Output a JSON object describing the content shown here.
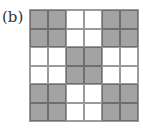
{
  "label": "(b)",
  "grid": {
    "rows": 6,
    "cols": 6,
    "shaded_color": "#a3a3a3",
    "empty_color": "#ffffff",
    "cells": [
      [
        1,
        1,
        0,
        0,
        1,
        1
      ],
      [
        1,
        1,
        0,
        0,
        1,
        1
      ],
      [
        0,
        0,
        1,
        1,
        0,
        0
      ],
      [
        0,
        0,
        1,
        1,
        0,
        0
      ],
      [
        1,
        1,
        0,
        0,
        1,
        1
      ],
      [
        1,
        1,
        0,
        0,
        1,
        1
      ]
    ]
  }
}
